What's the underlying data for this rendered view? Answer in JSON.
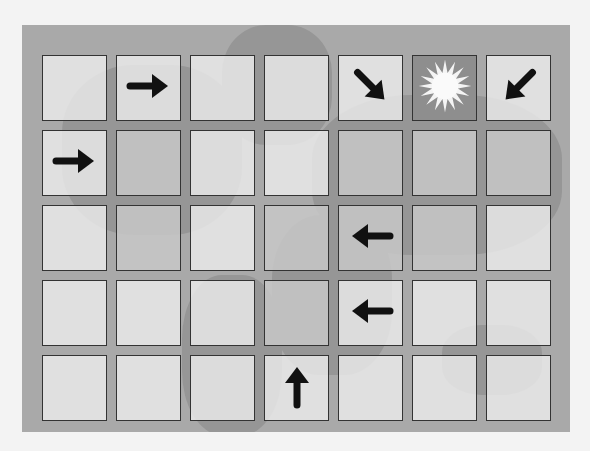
{
  "puzzle": {
    "rows": 5,
    "cols": 7,
    "background": "world-map",
    "cells": [
      [
        {
          "icon": ""
        },
        {
          "icon": "arrow-right"
        },
        {
          "icon": ""
        },
        {
          "icon": ""
        },
        {
          "icon": "arrow-down-right"
        },
        {
          "icon": "sun"
        },
        {
          "icon": "arrow-down-left"
        }
      ],
      [
        {
          "icon": "arrow-right"
        },
        {
          "icon": "",
          "shade": true
        },
        {
          "icon": ""
        },
        {
          "icon": ""
        },
        {
          "icon": "",
          "shade": true
        },
        {
          "icon": "",
          "shade": true
        },
        {
          "icon": "",
          "shade": true
        }
      ],
      [
        {
          "icon": ""
        },
        {
          "icon": "",
          "shade": true
        },
        {
          "icon": ""
        },
        {
          "icon": "",
          "shade": true
        },
        {
          "icon": "arrow-left",
          "shade": true
        },
        {
          "icon": "",
          "shade": true
        },
        {
          "icon": ""
        }
      ],
      [
        {
          "icon": ""
        },
        {
          "icon": ""
        },
        {
          "icon": ""
        },
        {
          "icon": "",
          "shade": true
        },
        {
          "icon": "arrow-left"
        },
        {
          "icon": ""
        },
        {
          "icon": ""
        }
      ],
      [
        {
          "icon": ""
        },
        {
          "icon": ""
        },
        {
          "icon": ""
        },
        {
          "icon": "arrow-up"
        },
        {
          "icon": ""
        },
        {
          "icon": ""
        },
        {
          "icon": ""
        }
      ]
    ]
  },
  "colors": {
    "board": "#a9a9a9",
    "cell": "#ececec",
    "sun_cell": "#8e8e8e",
    "arrow": "#111111"
  }
}
